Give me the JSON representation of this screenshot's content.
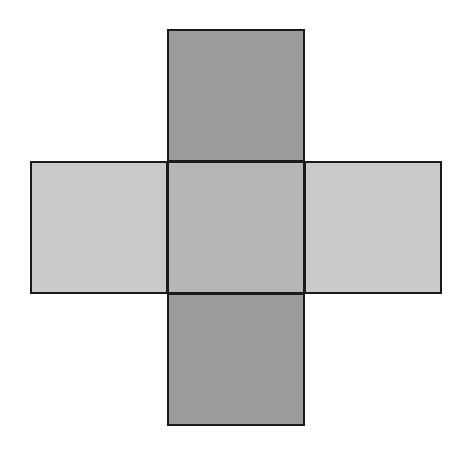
{
  "diagram": {
    "type": "cube-net",
    "background": "#ffffff",
    "stroke_color": "#1a1a1a",
    "faces": [
      {
        "id": "top",
        "x": 167,
        "y": 29,
        "w": 138,
        "h": 133,
        "fill": "#9c9c9c"
      },
      {
        "id": "left",
        "x": 30,
        "y": 161,
        "w": 138,
        "h": 133,
        "fill": "#c9c9c9"
      },
      {
        "id": "center",
        "x": 167,
        "y": 161,
        "w": 138,
        "h": 133,
        "fill": "#b6b6b6"
      },
      {
        "id": "right",
        "x": 304,
        "y": 161,
        "w": 138,
        "h": 133,
        "fill": "#c9c9c9"
      },
      {
        "id": "bottom",
        "x": 167,
        "y": 293,
        "w": 138,
        "h": 133,
        "fill": "#9c9c9c"
      }
    ]
  }
}
